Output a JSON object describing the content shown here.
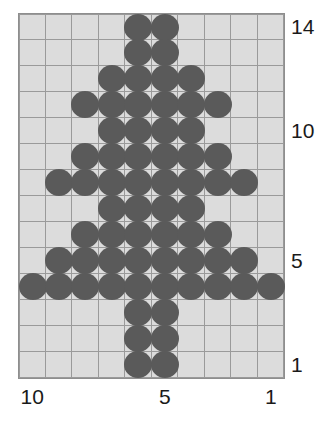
{
  "chart_data": {
    "type": "heatmap",
    "title": "",
    "xlabel": "",
    "ylabel": "",
    "columns": 10,
    "rows": 14,
    "x_tick_labels": [
      {
        "value": "10",
        "column": 1
      },
      {
        "value": "5",
        "column": 6
      },
      {
        "value": "1",
        "column": 10
      }
    ],
    "y_tick_labels": [
      {
        "value": "14",
        "row": 14
      },
      {
        "value": "10",
        "row": 10
      },
      {
        "value": "5",
        "row": 5
      },
      {
        "value": "1",
        "row": 1
      }
    ],
    "x_axis_direction": "descending-left-to-right",
    "y_axis_direction": "ascending-bottom-to-top",
    "colors": {
      "filled": "#5a5a5a",
      "empty": "#dcdcdc",
      "gridline": "#9a9a9a",
      "label": "#1a1a1a",
      "background": "#ffffff"
    },
    "grid": true,
    "legend": "none",
    "cell_shape": "circle",
    "note": "Rows listed top (row 14) to bottom (row 1); 1 = filled bead, 0 = empty.",
    "matrix": [
      [
        0,
        0,
        0,
        0,
        1,
        1,
        0,
        0,
        0,
        0
      ],
      [
        0,
        0,
        0,
        0,
        1,
        1,
        0,
        0,
        0,
        0
      ],
      [
        0,
        0,
        0,
        1,
        1,
        1,
        1,
        0,
        0,
        0
      ],
      [
        0,
        0,
        1,
        1,
        1,
        1,
        1,
        1,
        0,
        0
      ],
      [
        0,
        0,
        0,
        1,
        1,
        1,
        1,
        0,
        0,
        0
      ],
      [
        0,
        0,
        1,
        1,
        1,
        1,
        1,
        1,
        0,
        0
      ],
      [
        0,
        1,
        1,
        1,
        1,
        1,
        1,
        1,
        1,
        0
      ],
      [
        0,
        0,
        0,
        1,
        1,
        1,
        1,
        0,
        0,
        0
      ],
      [
        0,
        0,
        1,
        1,
        1,
        1,
        1,
        1,
        0,
        0
      ],
      [
        0,
        1,
        1,
        1,
        1,
        1,
        1,
        1,
        1,
        0
      ],
      [
        1,
        1,
        1,
        1,
        1,
        1,
        1,
        1,
        1,
        1
      ],
      [
        0,
        0,
        0,
        0,
        1,
        1,
        0,
        0,
        0,
        0
      ],
      [
        0,
        0,
        0,
        0,
        1,
        1,
        0,
        0,
        0,
        0
      ],
      [
        0,
        0,
        0,
        0,
        1,
        1,
        0,
        0,
        0,
        0
      ]
    ],
    "row_numbers_top_to_bottom": [
      14,
      13,
      12,
      11,
      10,
      9,
      8,
      7,
      6,
      5,
      4,
      3,
      2,
      1
    ],
    "filled_count": 76
  }
}
